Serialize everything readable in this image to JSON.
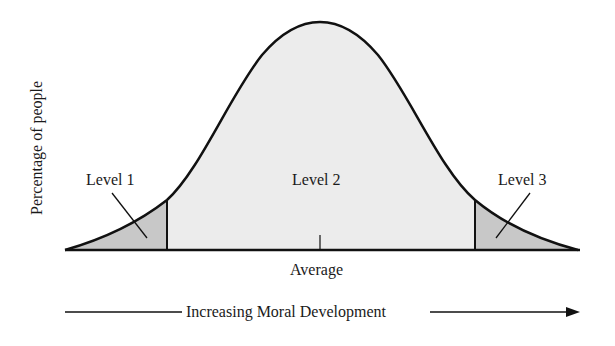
{
  "diagram": {
    "type": "normal-distribution",
    "y_axis_label": "Percentage of people",
    "x_axis_center_label": "Average",
    "x_axis_direction_label": "Increasing Moral Development",
    "regions": [
      {
        "label": "Level 1",
        "position": "left tail",
        "fill": "#c8c8c8"
      },
      {
        "label": "Level 2",
        "position": "center",
        "fill": "#ececec"
      },
      {
        "label": "Level 3",
        "position": "right tail",
        "fill": "#c8c8c8"
      }
    ],
    "colors": {
      "line": "#111111",
      "center_fill": "#ececec",
      "tail_fill": "#c8c8c8"
    }
  }
}
